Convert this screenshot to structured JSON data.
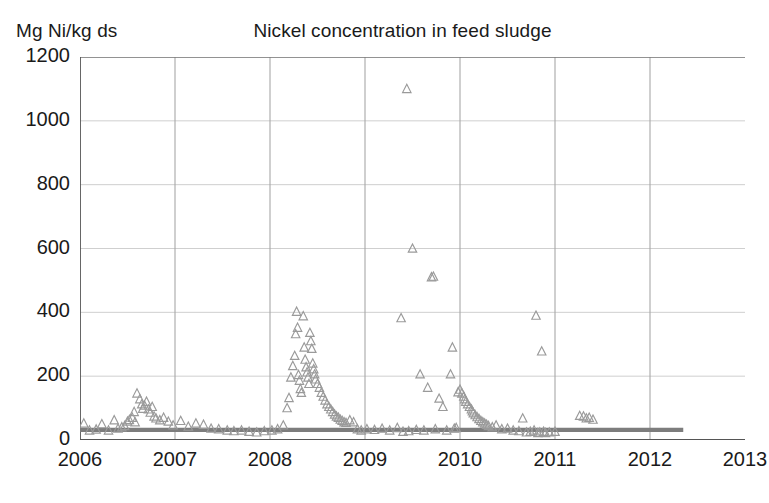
{
  "chart_data": {
    "type": "scatter",
    "title": "Nickel concentration in feed sludge",
    "ylabel": "Mg Ni/kg ds",
    "xlabel": "",
    "xlim": [
      2006,
      2013
    ],
    "ylim": [
      0,
      1200
    ],
    "xticks": [
      2006,
      2007,
      2008,
      2009,
      2010,
      2011,
      2012,
      2013
    ],
    "xtick_labels": [
      "2006",
      "2007",
      "2008",
      "2009",
      "2010",
      "2011",
      "2012",
      "2013"
    ],
    "yticks": [
      0,
      200,
      400,
      600,
      800,
      1000,
      1200
    ],
    "ytick_labels": [
      "0",
      "200",
      "400",
      "600",
      "800",
      "1000",
      "1200"
    ],
    "grid": "vertical-and-horizontal-light",
    "legend": "none",
    "marker": "open-triangle",
    "marker_color": "#9a9a9a",
    "threshold_line": {
      "label": "",
      "value": 32,
      "color": "#7d7d7d",
      "x_start": 2006.0,
      "x_end": 2012.35
    },
    "series": [
      {
        "name": "Nickel concentration",
        "points": [
          [
            2006.04,
            52
          ],
          [
            2006.1,
            30
          ],
          [
            2006.17,
            33
          ],
          [
            2006.23,
            50
          ],
          [
            2006.3,
            30
          ],
          [
            2006.36,
            62
          ],
          [
            2006.4,
            36
          ],
          [
            2006.44,
            40
          ],
          [
            2006.47,
            44
          ],
          [
            2006.5,
            58
          ],
          [
            2006.52,
            63
          ],
          [
            2006.55,
            70
          ],
          [
            2006.57,
            88
          ],
          [
            2006.58,
            56
          ],
          [
            2006.6,
            146
          ],
          [
            2006.63,
            128
          ],
          [
            2006.65,
            112
          ],
          [
            2006.66,
            98
          ],
          [
            2006.68,
            108
          ],
          [
            2006.7,
            120
          ],
          [
            2006.72,
            96
          ],
          [
            2006.74,
            86
          ],
          [
            2006.76,
            104
          ],
          [
            2006.78,
            74
          ],
          [
            2006.8,
            68
          ],
          [
            2006.84,
            62
          ],
          [
            2006.88,
            70
          ],
          [
            2006.93,
            58
          ],
          [
            2006.98,
            46
          ],
          [
            2007.06,
            60
          ],
          [
            2007.14,
            42
          ],
          [
            2007.22,
            52
          ],
          [
            2007.3,
            48
          ],
          [
            2007.38,
            36
          ],
          [
            2007.46,
            34
          ],
          [
            2007.55,
            30
          ],
          [
            2007.62,
            28
          ],
          [
            2007.7,
            30
          ],
          [
            2007.78,
            26
          ],
          [
            2007.86,
            24
          ],
          [
            2007.94,
            28
          ],
          [
            2008.02,
            30
          ],
          [
            2008.08,
            34
          ],
          [
            2008.14,
            46
          ],
          [
            2008.18,
            100
          ],
          [
            2008.2,
            132
          ],
          [
            2008.22,
            196
          ],
          [
            2008.24,
            232
          ],
          [
            2008.26,
            264
          ],
          [
            2008.27,
            332
          ],
          [
            2008.28,
            402
          ],
          [
            2008.29,
            352
          ],
          [
            2008.3,
            204
          ],
          [
            2008.31,
            186
          ],
          [
            2008.32,
            160
          ],
          [
            2008.33,
            148
          ],
          [
            2008.35,
            388
          ],
          [
            2008.36,
            290
          ],
          [
            2008.37,
            252
          ],
          [
            2008.38,
            228
          ],
          [
            2008.39,
            212
          ],
          [
            2008.4,
            196
          ],
          [
            2008.41,
            176
          ],
          [
            2008.42,
            336
          ],
          [
            2008.43,
            310
          ],
          [
            2008.44,
            286
          ],
          [
            2008.45,
            240
          ],
          [
            2008.46,
            222
          ],
          [
            2008.47,
            206
          ],
          [
            2008.48,
            190
          ],
          [
            2008.5,
            176
          ],
          [
            2008.52,
            164
          ],
          [
            2008.54,
            148
          ],
          [
            2008.56,
            136
          ],
          [
            2008.58,
            124
          ],
          [
            2008.6,
            112
          ],
          [
            2008.62,
            104
          ],
          [
            2008.64,
            96
          ],
          [
            2008.66,
            88
          ],
          [
            2008.68,
            80
          ],
          [
            2008.7,
            74
          ],
          [
            2008.72,
            70
          ],
          [
            2008.74,
            64
          ],
          [
            2008.76,
            60
          ],
          [
            2008.78,
            56
          ],
          [
            2008.8,
            54
          ],
          [
            2008.84,
            62
          ],
          [
            2008.88,
            56
          ],
          [
            2008.92,
            34
          ],
          [
            2008.96,
            30
          ],
          [
            2009.02,
            34
          ],
          [
            2009.1,
            32
          ],
          [
            2009.18,
            36
          ],
          [
            2009.26,
            30
          ],
          [
            2009.34,
            38
          ],
          [
            2009.38,
            382
          ],
          [
            2009.4,
            26
          ],
          [
            2009.44,
            1100
          ],
          [
            2009.46,
            28
          ],
          [
            2009.5,
            600
          ],
          [
            2009.54,
            32
          ],
          [
            2009.58,
            206
          ],
          [
            2009.62,
            30
          ],
          [
            2009.66,
            164
          ],
          [
            2009.7,
            510
          ],
          [
            2009.72,
            512
          ],
          [
            2009.74,
            34
          ],
          [
            2009.78,
            130
          ],
          [
            2009.82,
            104
          ],
          [
            2009.86,
            30
          ],
          [
            2009.9,
            206
          ],
          [
            2009.92,
            290
          ],
          [
            2009.94,
            36
          ],
          [
            2009.96,
            38
          ],
          [
            2009.98,
            150
          ],
          [
            2010.0,
            158
          ],
          [
            2010.02,
            146
          ],
          [
            2010.04,
            136
          ],
          [
            2010.05,
            128
          ],
          [
            2010.06,
            120
          ],
          [
            2010.08,
            112
          ],
          [
            2010.1,
            104
          ],
          [
            2010.12,
            96
          ],
          [
            2010.13,
            90
          ],
          [
            2010.14,
            84
          ],
          [
            2010.16,
            78
          ],
          [
            2010.18,
            72
          ],
          [
            2010.2,
            66
          ],
          [
            2010.22,
            60
          ],
          [
            2010.24,
            56
          ],
          [
            2010.26,
            52
          ],
          [
            2010.28,
            48
          ],
          [
            2010.3,
            44
          ],
          [
            2010.34,
            40
          ],
          [
            2010.38,
            46
          ],
          [
            2010.44,
            34
          ],
          [
            2010.5,
            36
          ],
          [
            2010.56,
            30
          ],
          [
            2010.62,
            28
          ],
          [
            2010.66,
            68
          ],
          [
            2010.7,
            24
          ],
          [
            2010.74,
            26
          ],
          [
            2010.78,
            30
          ],
          [
            2010.8,
            390
          ],
          [
            2010.82,
            22
          ],
          [
            2010.84,
            24
          ],
          [
            2010.86,
            278
          ],
          [
            2010.88,
            26
          ],
          [
            2010.9,
            22
          ],
          [
            2010.94,
            24
          ],
          [
            2011.0,
            26
          ],
          [
            2011.26,
            76
          ],
          [
            2011.3,
            74
          ],
          [
            2011.33,
            68
          ],
          [
            2011.36,
            70
          ],
          [
            2011.4,
            64
          ]
        ]
      }
    ]
  }
}
